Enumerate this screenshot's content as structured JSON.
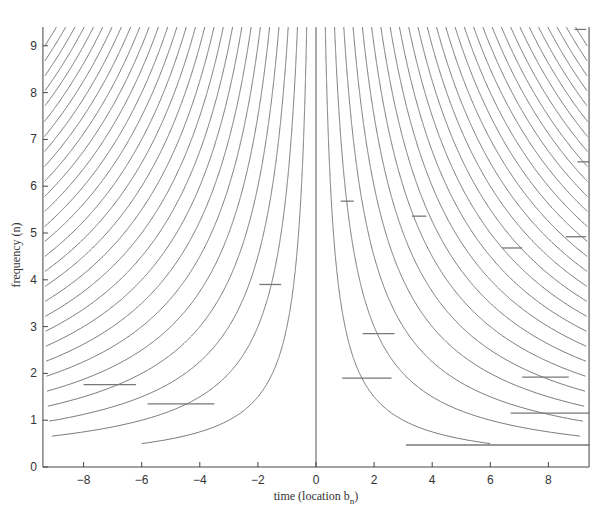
{
  "chart_data": {
    "type": "line",
    "title": "",
    "xlabel": "time (location b",
    "xlabel_subscript": "n",
    "xlabel_close": ")",
    "ylabel": "frequency (n)",
    "xlim": [
      -9.4,
      9.4
    ],
    "ylim": [
      0,
      9.4
    ],
    "xticks": [
      -8,
      -6,
      -4,
      -2,
      0,
      2,
      4,
      6,
      8
    ],
    "yticks": [
      0,
      1,
      2,
      3,
      4,
      5,
      6,
      7,
      8,
      9
    ],
    "grid": false,
    "legend": null,
    "curve_family": {
      "description": "Hyperbolic time-frequency ridges n = c*k/|t|, mirrored about t=0",
      "c": 3.0,
      "k_range": [
        1,
        28
      ],
      "n_min_visible": 0.5,
      "color": "#6a6a6a"
    },
    "center_line": {
      "t": 0,
      "n_from": 0,
      "n_to": 9.4
    },
    "segments": [
      {
        "t_from": -8.0,
        "t_to": -6.2,
        "n": 1.76
      },
      {
        "t_from": -5.8,
        "t_to": -3.5,
        "n": 1.35
      },
      {
        "t_from": -1.95,
        "t_to": -1.2,
        "n": 3.9
      },
      {
        "t_from": 0.9,
        "t_to": 2.6,
        "n": 1.9
      },
      {
        "t_from": 1.6,
        "t_to": 2.7,
        "n": 2.85
      },
      {
        "t_from": 0.85,
        "t_to": 1.3,
        "n": 5.68
      },
      {
        "t_from": 3.3,
        "t_to": 3.8,
        "n": 5.36
      },
      {
        "t_from": 6.4,
        "t_to": 7.1,
        "n": 4.68
      },
      {
        "t_from": 8.6,
        "t_to": 9.3,
        "n": 4.92
      },
      {
        "t_from": 9.0,
        "t_to": 9.4,
        "n": 6.52
      },
      {
        "t_from": 8.9,
        "t_to": 9.3,
        "n": 9.35
      },
      {
        "t_from": 7.1,
        "t_to": 8.7,
        "n": 1.92
      },
      {
        "t_from": 6.7,
        "t_to": 9.4,
        "n": 1.15
      },
      {
        "t_from": 3.1,
        "t_to": 9.4,
        "n": 0.47
      }
    ]
  }
}
